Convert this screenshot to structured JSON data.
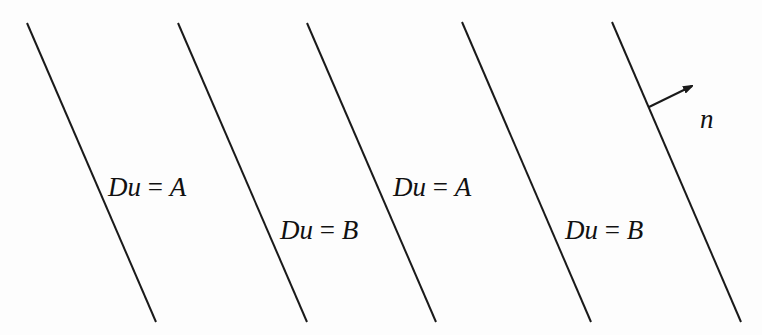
{
  "diagram": {
    "title": "",
    "lines": [
      {
        "id": "line-1",
        "x1": 27,
        "y1": 23,
        "x2": 156,
        "y2": 322
      },
      {
        "id": "line-2",
        "x1": 178,
        "y1": 23,
        "x2": 307,
        "y2": 322
      },
      {
        "id": "line-3",
        "x1": 307,
        "y1": 23,
        "x2": 436,
        "y2": 322
      },
      {
        "id": "line-4",
        "x1": 462,
        "y1": 22,
        "x2": 591,
        "y2": 322
      },
      {
        "id": "line-5",
        "x1": 612,
        "y1": 22,
        "x2": 741,
        "y2": 322
      }
    ],
    "regions": [
      {
        "lhs": "Du",
        "eq": "=",
        "rhs": "A",
        "x": 108,
        "y": 196
      },
      {
        "lhs": "Du",
        "eq": "=",
        "rhs": "B",
        "x": 280,
        "y": 239
      },
      {
        "lhs": "Du",
        "eq": "=",
        "rhs": "A",
        "x": 393,
        "y": 196
      },
      {
        "lhs": "Du",
        "eq": "=",
        "rhs": "B",
        "x": 565,
        "y": 239
      }
    ],
    "normal_vector": {
      "label": "n",
      "from": [
        649,
        107
      ],
      "to": [
        692,
        86
      ],
      "label_pos": [
        700,
        128
      ]
    },
    "labels": {
      "region_1": "Du = A",
      "region_2": "Du = B",
      "region_3": "Du = A",
      "region_4": "Du = B",
      "normal": "n"
    },
    "colors": {
      "line": "#1a1a1a",
      "text": "#111111",
      "background": "#fdfdfd"
    }
  }
}
